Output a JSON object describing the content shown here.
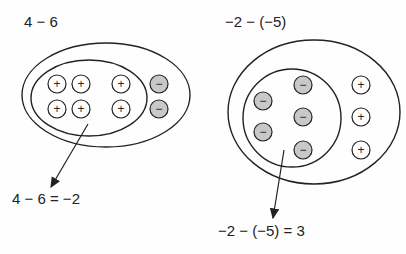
{
  "left": {
    "title": "4 − 6",
    "result": "4 − 6 = −2",
    "positives": 6,
    "negatives": 2
  },
  "right": {
    "title": "−2 − (−5)",
    "result": "−2 − (−5) = 3",
    "positives": 3,
    "negatives": 5
  },
  "symbols": {
    "plus": "+",
    "minus": "−"
  },
  "colors": {
    "negative_fill": "#c8c8c8",
    "positive_fill": "#ffffff",
    "stroke": "#222222"
  }
}
